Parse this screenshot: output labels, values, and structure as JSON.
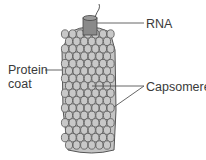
{
  "diagram": {
    "labels": {
      "rna": "RNA",
      "protein_coat_line1": "Protein",
      "protein_coat_line2": "coat",
      "capsomeres": "Capsomeres"
    },
    "colors": {
      "background": "#ffffff",
      "capsomere_fill": "#c4c4c4",
      "capsomere_stroke": "#555555",
      "rna_core_fill": "#8a8a8a",
      "leader_line": "#555555",
      "text": "#3a3a3a"
    }
  }
}
